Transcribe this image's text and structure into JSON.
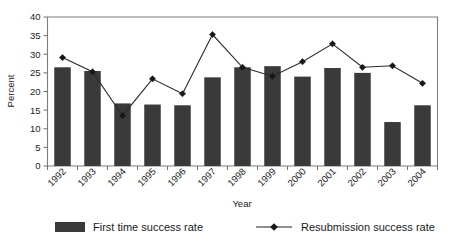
{
  "chart_data": {
    "type": "bar",
    "title": "",
    "xlabel": "Year",
    "ylabel": "Percent",
    "ylim": [
      0,
      40
    ],
    "yticks": [
      0,
      5,
      10,
      15,
      20,
      25,
      30,
      35,
      40
    ],
    "grid": false,
    "legend_position": "bottom",
    "categories": [
      "1992",
      "1993",
      "1994",
      "1995",
      "1996",
      "1997",
      "1998",
      "1999",
      "2000",
      "2001",
      "2002",
      "2003",
      "2004"
    ],
    "series": [
      {
        "name": "First time success rate",
        "type": "bar",
        "color": "#3a3a3a",
        "values": [
          26.5,
          25.5,
          16.8,
          16.5,
          16.3,
          23.8,
          26.5,
          26.8,
          24.0,
          26.3,
          25.0,
          11.8,
          16.3
        ]
      },
      {
        "name": "Resubmission success rate",
        "type": "line",
        "color": "#1f1f1f",
        "values": [
          29.1,
          25.3,
          13.5,
          23.4,
          19.4,
          35.3,
          26.5,
          24.1,
          28.0,
          32.8,
          26.5,
          26.9,
          22.2
        ]
      }
    ]
  },
  "legend": {
    "items": [
      {
        "label": "First time success rate",
        "marker": "bar-swatch"
      },
      {
        "label": "Resubmission success rate",
        "marker": "line-marker"
      }
    ]
  },
  "axes": {
    "y_title": "Percent",
    "x_title": "Year"
  }
}
